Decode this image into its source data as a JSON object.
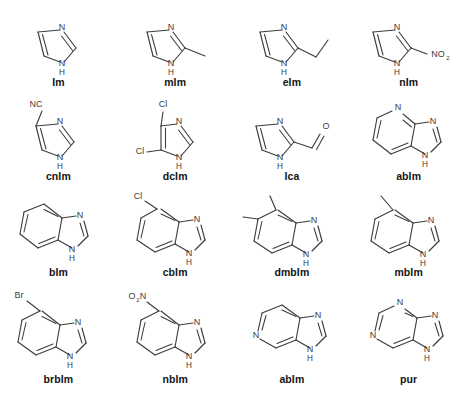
{
  "figure": {
    "kind": "chemical-structure-grid",
    "rows": 4,
    "columns": 4,
    "background_color": "#ffffff",
    "bond_color": "#3d3d3d",
    "label_color": "#141414"
  },
  "molecules": [
    {
      "id": "im",
      "label": "Im",
      "core": "imidazole",
      "atom_labels": [
        "N",
        "N",
        "H"
      ],
      "substituents": []
    },
    {
      "id": "mim",
      "label": "mIm",
      "core": "imidazole",
      "atom_labels": [
        "N",
        "N",
        "H"
      ],
      "substituents": [
        "methyl"
      ]
    },
    {
      "id": "eim",
      "label": "eIm",
      "core": "imidazole",
      "atom_labels": [
        "N",
        "N",
        "H"
      ],
      "substituents": [
        "ethyl"
      ]
    },
    {
      "id": "nim",
      "label": "nIm",
      "core": "imidazole",
      "atom_labels": [
        "N",
        "N",
        "H",
        "NO",
        "2"
      ],
      "substituents": [
        "nitro"
      ]
    },
    {
      "id": "cnim",
      "label": "cnIm",
      "core": "imidazole",
      "atom_labels": [
        "NC",
        "N",
        "N",
        "H"
      ],
      "substituents": [
        "cyano"
      ]
    },
    {
      "id": "dcim",
      "label": "dcIm",
      "core": "imidazole",
      "atom_labels": [
        "Cl",
        "Cl",
        "N",
        "N",
        "H"
      ],
      "substituents": [
        "chloro",
        "chloro"
      ]
    },
    {
      "id": "ica",
      "label": "Ica",
      "core": "imidazole",
      "atom_labels": [
        "N",
        "N",
        "H",
        "O"
      ],
      "substituents": [
        "carbaldehyde"
      ]
    },
    {
      "id": "abim-2",
      "label": "abIm",
      "core": "azabenzimidazole",
      "atom_labels": [
        "N",
        "N",
        "N",
        "H"
      ],
      "substituents": []
    },
    {
      "id": "bim",
      "label": "bIm",
      "core": "benzimidazole",
      "atom_labels": [
        "N",
        "N",
        "H"
      ],
      "substituents": []
    },
    {
      "id": "cbim",
      "label": "cbIm",
      "core": "benzimidazole",
      "atom_labels": [
        "Cl",
        "N",
        "N",
        "H"
      ],
      "substituents": [
        "chloro"
      ]
    },
    {
      "id": "dmbim",
      "label": "dmbIm",
      "core": "benzimidazole",
      "atom_labels": [
        "N",
        "N",
        "H"
      ],
      "substituents": [
        "methyl",
        "methyl"
      ]
    },
    {
      "id": "mbim",
      "label": "mbIm",
      "core": "benzimidazole",
      "atom_labels": [
        "N",
        "N",
        "H"
      ],
      "substituents": [
        "methyl"
      ]
    },
    {
      "id": "brbim",
      "label": "brbIm",
      "core": "benzimidazole",
      "atom_labels": [
        "Br",
        "N",
        "N",
        "H"
      ],
      "substituents": [
        "bromo"
      ]
    },
    {
      "id": "nbim",
      "label": "nbIm",
      "core": "benzimidazole",
      "atom_labels": [
        "O",
        "2",
        "N",
        "N",
        "N",
        "H"
      ],
      "substituents": [
        "nitro"
      ]
    },
    {
      "id": "abim-4",
      "label": "abIm",
      "core": "azabenzimidazole",
      "atom_labels": [
        "N",
        "N",
        "N",
        "H"
      ],
      "substituents": []
    },
    {
      "id": "pur",
      "label": "pur",
      "core": "purine",
      "atom_labels": [
        "N",
        "N",
        "N",
        "N",
        "H"
      ],
      "substituents": []
    }
  ]
}
